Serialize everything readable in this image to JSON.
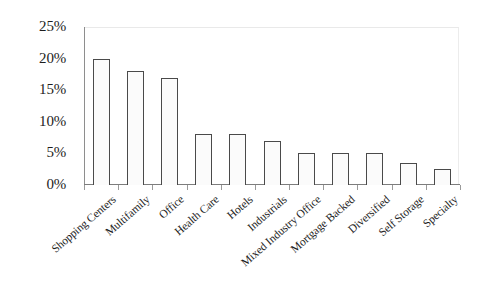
{
  "chart_data": {
    "type": "bar",
    "title": "",
    "subtitle": "",
    "xlabel": "",
    "ylabel": "",
    "categories": [
      "Shopping Centers",
      "Multifamily",
      "Office",
      "Health Care",
      "Hotels",
      "Industrials",
      "Mixed Industry Office",
      "Mortgage Backed",
      "Diversified",
      "Self Storage",
      "Specialty"
    ],
    "values": [
      20,
      18,
      17,
      8,
      8,
      7,
      5,
      5,
      5,
      3.5,
      2.5
    ],
    "value_unit": "%",
    "ylim": [
      0,
      25
    ],
    "yticks": [
      0,
      5,
      10,
      15,
      20,
      25
    ],
    "ytick_labels": [
      "0%",
      "5%",
      "10%",
      "15%",
      "20%",
      "25%"
    ],
    "grid": false,
    "legend": false,
    "legend_position": "none",
    "bar_fill_color": "#fbfbfb",
    "bar_border_color": "#4a4a4a",
    "axis_color": "#7d7d7d",
    "text_color": "#1d1d1d",
    "background_color": "#ffffff",
    "label_rotation_degrees": -41
  }
}
